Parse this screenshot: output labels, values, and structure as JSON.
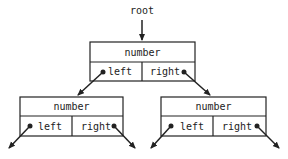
{
  "diagram": {
    "type": "binary-tree-node-structure",
    "root_label": "root",
    "nodes": [
      {
        "id": "top",
        "value_label": "number",
        "left_label": "left",
        "right_label": "right"
      },
      {
        "id": "left-child",
        "value_label": "number",
        "left_label": "left",
        "right_label": "right"
      },
      {
        "id": "right-child",
        "value_label": "number",
        "left_label": "left",
        "right_label": "right"
      }
    ],
    "colors": {
      "stroke": "#222222",
      "background": "#ffffff"
    }
  }
}
